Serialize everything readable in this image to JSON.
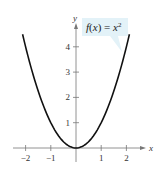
{
  "chart_data": {
    "type": "line",
    "title": "",
    "function_label": "f(x) = x²",
    "function_label_parts": {
      "f": "f",
      "open": "(",
      "x": "x",
      "close": ")",
      "eq": " = ",
      "base": "x",
      "exp": "2"
    },
    "xlabel": "x",
    "ylabel": "y",
    "xlim": [
      -2.2,
      2.2
    ],
    "ylim": [
      0,
      4.5
    ],
    "x_ticks": [
      -2,
      -1,
      1,
      2
    ],
    "x_tick_labels": [
      "−2",
      "−1",
      "1",
      "2"
    ],
    "y_ticks": [
      1,
      2,
      3,
      4
    ],
    "y_tick_labels": [
      "1",
      "2",
      "3",
      "4"
    ],
    "grid": false,
    "series": [
      {
        "name": "f(x) = x^2",
        "x": [
          -2.12,
          -2,
          -1.5,
          -1,
          -0.5,
          0,
          0.5,
          1,
          1.5,
          2,
          2.12
        ],
        "y": [
          4.5,
          4,
          2.25,
          1,
          0.25,
          0,
          0.25,
          1,
          2.25,
          4,
          4.5
        ]
      }
    ],
    "colors": {
      "curve": "#111111",
      "axes": "#777777",
      "callout": "#d8eef6"
    }
  }
}
